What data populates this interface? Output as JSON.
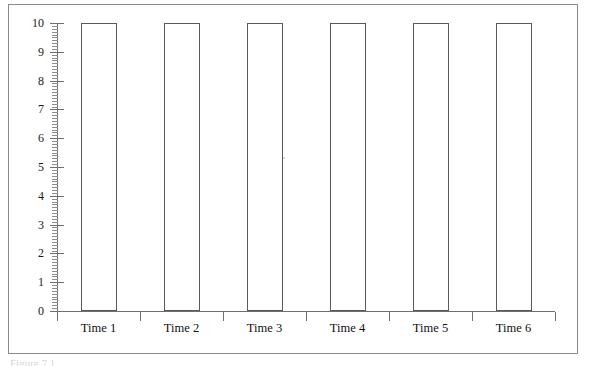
{
  "figure": {
    "caption": "Figure 7.1",
    "frame_color": "#8a8a8a",
    "background": "#ffffff"
  },
  "chart_data": {
    "type": "bar",
    "title": "",
    "subtitle": "",
    "xlabel": "",
    "ylabel": "",
    "categories": [
      "Time 1",
      "Time 2",
      "Time 3",
      "Time 4",
      "Time 5",
      "Time 6"
    ],
    "values": [
      10,
      10,
      10,
      10,
      10,
      10
    ],
    "series": [
      {
        "name": "",
        "values": [
          10,
          10,
          10,
          10,
          10,
          10
        ]
      }
    ],
    "ylim": [
      0,
      10
    ],
    "xlim": [
      0,
      6
    ],
    "y_tick_labels": [
      "0",
      "1",
      "2",
      "3",
      "4",
      "5",
      "6",
      "7",
      "8",
      "9",
      "10"
    ],
    "y_major_tick_step": 1,
    "y_minor_ticks_per_unit": 10,
    "grid": false,
    "legend": null,
    "legend_position": "none",
    "bar_fill_color": "#ffffff",
    "bar_edge_color": "#595959",
    "axis_color": "#6f6f6f",
    "annotations": []
  }
}
